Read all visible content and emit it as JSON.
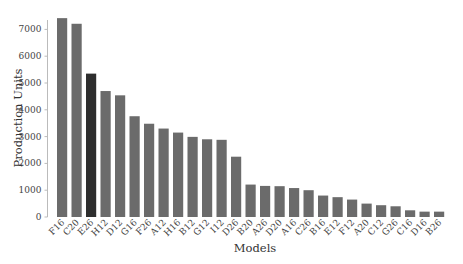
{
  "chart_data": {
    "type": "bar",
    "title": "",
    "xlabel": "Models",
    "ylabel": "Production Units",
    "ylim": [
      0,
      7500
    ],
    "yticks": [
      0,
      1000,
      2000,
      3000,
      4000,
      5000,
      6000,
      7000
    ],
    "grid": false,
    "legend": null,
    "categories": [
      "F16",
      "C20",
      "E26",
      "H12",
      "D12",
      "G16",
      "F26",
      "A12",
      "H16",
      "B12",
      "G12",
      "I12",
      "D26",
      "B20",
      "A26",
      "D20",
      "A16",
      "C26",
      "B16",
      "E12",
      "F12",
      "A20",
      "C12",
      "G26",
      "C16",
      "D16",
      "B26"
    ],
    "values": [
      7420,
      7210,
      5350,
      4700,
      4540,
      3760,
      3480,
      3300,
      3150,
      2990,
      2900,
      2880,
      2250,
      1210,
      1160,
      1150,
      1080,
      1000,
      800,
      740,
      650,
      500,
      440,
      400,
      250,
      200,
      200
    ],
    "highlight": {
      "category": "E26",
      "color": "#2e2e2e"
    },
    "bar_color": "#6b6b6b",
    "axis_color": "#bbbbbb"
  }
}
